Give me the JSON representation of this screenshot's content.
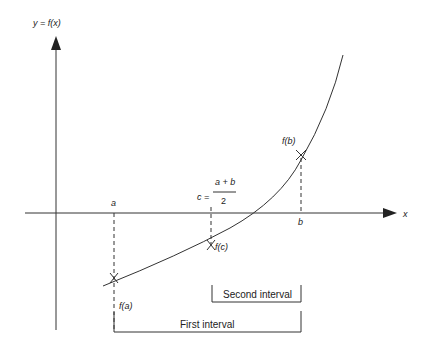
{
  "diagram": {
    "y_axis_label": "y = f(x)",
    "x_axis_label": "x",
    "points": {
      "a": "a",
      "b": "b",
      "c_lhs": "c =",
      "c_numerator": "a + b",
      "c_denominator": "2"
    },
    "function_values": {
      "fa": "f(a)",
      "fb": "f(b)",
      "fc": "f(c)"
    },
    "intervals": {
      "first": "First interval",
      "second": "Second interval"
    },
    "colors": {
      "line": "#333333",
      "text": "#222222",
      "background": "#ffffff"
    }
  }
}
